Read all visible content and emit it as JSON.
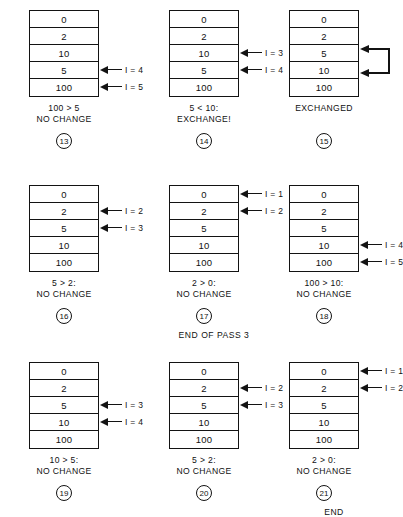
{
  "figure": {
    "ink_color": "#131313",
    "background_color": "#ffffff"
  },
  "panels": [
    {
      "id": "13",
      "badge": "13",
      "cells": [
        "0",
        "2",
        "10",
        "5",
        "100"
      ],
      "pointers": [
        {
          "row": 4,
          "label": "I = 4"
        },
        {
          "row": 5,
          "label": "I = 5"
        }
      ],
      "swap": null,
      "caption": {
        "line1": "100 > 5",
        "line2": "NO CHANGE"
      },
      "note": ""
    },
    {
      "id": "14",
      "badge": "14",
      "cells": [
        "0",
        "2",
        "10",
        "5",
        "100"
      ],
      "pointers": [
        {
          "row": 3,
          "label": "I = 3"
        },
        {
          "row": 4,
          "label": "I = 4"
        }
      ],
      "swap": null,
      "caption": {
        "line1": "5 < 10:",
        "line2": "EXCHANGE!"
      },
      "note": ""
    },
    {
      "id": "15",
      "badge": "15",
      "cells": [
        "0",
        "2",
        "5",
        "10",
        "100"
      ],
      "pointers": [],
      "swap": {
        "row_top": 3,
        "row_bottom": 4
      },
      "caption": {
        "line1": "",
        "line2": "EXCHANGED"
      },
      "note": ""
    },
    {
      "id": "16",
      "badge": "16",
      "cells": [
        "0",
        "2",
        "5",
        "10",
        "100"
      ],
      "pointers": [
        {
          "row": 2,
          "label": "I = 2"
        },
        {
          "row": 3,
          "label": "I = 3"
        }
      ],
      "swap": null,
      "caption": {
        "line1": "5 > 2:",
        "line2": "NO CHANGE"
      },
      "note": ""
    },
    {
      "id": "17",
      "badge": "17",
      "cells": [
        "0",
        "2",
        "5",
        "10",
        "100"
      ],
      "pointers": [
        {
          "row": 1,
          "label": "I = 1"
        },
        {
          "row": 2,
          "label": "I = 2"
        }
      ],
      "swap": null,
      "caption": {
        "line1": "2 > 0:",
        "line2": "NO CHANGE"
      },
      "note": "END OF PASS 3"
    },
    {
      "id": "18",
      "badge": "18",
      "cells": [
        "0",
        "2",
        "5",
        "10",
        "100"
      ],
      "pointers": [
        {
          "row": 4,
          "label": "I = 4"
        },
        {
          "row": 5,
          "label": "I = 5"
        }
      ],
      "swap": null,
      "caption": {
        "line1": "100 > 10:",
        "line2": "NO CHANGE"
      },
      "note": ""
    },
    {
      "id": "19",
      "badge": "19",
      "cells": [
        "0",
        "2",
        "5",
        "10",
        "100"
      ],
      "pointers": [
        {
          "row": 3,
          "label": "I = 3"
        },
        {
          "row": 4,
          "label": "I = 4"
        }
      ],
      "swap": null,
      "caption": {
        "line1": "10 > 5:",
        "line2": "NO CHANGE"
      },
      "note": ""
    },
    {
      "id": "20",
      "badge": "20",
      "cells": [
        "0",
        "2",
        "5",
        "10",
        "100"
      ],
      "pointers": [
        {
          "row": 2,
          "label": "I = 2"
        },
        {
          "row": 3,
          "label": "I = 3"
        }
      ],
      "swap": null,
      "caption": {
        "line1": "5 > 2:",
        "line2": "NO CHANGE"
      },
      "note": ""
    },
    {
      "id": "21",
      "badge": "21",
      "cells": [
        "0",
        "2",
        "5",
        "10",
        "100"
      ],
      "pointers": [
        {
          "row": 1,
          "label": "I = 1"
        },
        {
          "row": 2,
          "label": "I = 2"
        }
      ],
      "swap": null,
      "caption": {
        "line1": "2 > 0:",
        "line2": "NO CHANGE"
      },
      "note": "END"
    }
  ],
  "layout": {
    "columns_x": [
      8,
      148,
      268
    ],
    "rows_y": [
      10,
      185,
      362
    ],
    "cell_height": 17
  }
}
